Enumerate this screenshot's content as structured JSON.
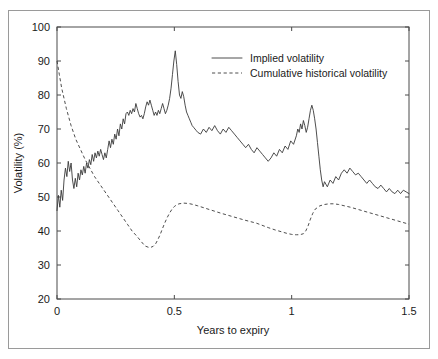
{
  "chart_data": {
    "type": "line",
    "title": "",
    "xlabel": "Years to expiry",
    "ylabel": "Volatility (%)",
    "xlim": [
      0,
      1.5
    ],
    "ylim": [
      20,
      100
    ],
    "xticks": [
      "0",
      "0.5",
      "1",
      "1.5"
    ],
    "xtick_values": [
      0,
      0.5,
      1,
      1.5
    ],
    "yticks": [
      "20",
      "30",
      "40",
      "50",
      "60",
      "70",
      "80",
      "90",
      "100"
    ],
    "ytick_values": [
      20,
      30,
      40,
      50,
      60,
      70,
      80,
      90,
      100
    ],
    "grid": false,
    "legend_position": "upper center",
    "line_color": "#3a3a3a",
    "axis_color": "#4a4a4a",
    "border_color": "#9a9a9a",
    "series": [
      {
        "name": "Implied volatility",
        "style": "solid",
        "x": [
          0.0,
          0.006,
          0.012,
          0.018,
          0.024,
          0.03,
          0.036,
          0.042,
          0.048,
          0.054,
          0.06,
          0.066,
          0.072,
          0.078,
          0.084,
          0.09,
          0.096,
          0.102,
          0.108,
          0.114,
          0.12,
          0.126,
          0.132,
          0.138,
          0.144,
          0.15,
          0.156,
          0.162,
          0.168,
          0.174,
          0.18,
          0.186,
          0.192,
          0.198,
          0.204,
          0.21,
          0.216,
          0.222,
          0.228,
          0.234,
          0.24,
          0.246,
          0.252,
          0.258,
          0.264,
          0.27,
          0.276,
          0.282,
          0.288,
          0.294,
          0.3,
          0.306,
          0.312,
          0.318,
          0.324,
          0.33,
          0.336,
          0.342,
          0.348,
          0.354,
          0.36,
          0.366,
          0.372,
          0.378,
          0.384,
          0.39,
          0.396,
          0.402,
          0.408,
          0.414,
          0.42,
          0.426,
          0.432,
          0.438,
          0.444,
          0.45,
          0.456,
          0.462,
          0.468,
          0.474,
          0.48,
          0.486,
          0.492,
          0.498,
          0.504,
          0.51,
          0.516,
          0.522,
          0.528,
          0.534,
          0.54,
          0.546,
          0.552,
          0.558,
          0.564,
          0.57,
          0.576,
          0.582,
          0.588,
          0.594,
          0.6,
          0.612,
          0.624,
          0.636,
          0.648,
          0.66,
          0.672,
          0.684,
          0.696,
          0.708,
          0.72,
          0.732,
          0.744,
          0.756,
          0.768,
          0.78,
          0.792,
          0.804,
          0.816,
          0.828,
          0.84,
          0.852,
          0.864,
          0.876,
          0.888,
          0.9,
          0.912,
          0.924,
          0.936,
          0.948,
          0.96,
          0.972,
          0.984,
          0.996,
          1.008,
          1.02,
          1.026,
          1.032,
          1.038,
          1.044,
          1.05,
          1.056,
          1.062,
          1.068,
          1.074,
          1.08,
          1.086,
          1.092,
          1.098,
          1.104,
          1.11,
          1.116,
          1.122,
          1.128,
          1.134,
          1.14,
          1.152,
          1.164,
          1.176,
          1.188,
          1.2,
          1.212,
          1.224,
          1.236,
          1.248,
          1.26,
          1.272,
          1.284,
          1.296,
          1.308,
          1.32,
          1.332,
          1.344,
          1.356,
          1.368,
          1.38,
          1.392,
          1.404,
          1.416,
          1.428,
          1.44,
          1.452,
          1.464,
          1.476,
          1.488,
          1.5
        ],
        "y": [
          46.0,
          50.5,
          47.0,
          52.0,
          49.0,
          55.0,
          58.5,
          56.0,
          60.5,
          57.5,
          60.0,
          55.0,
          52.5,
          55.5,
          53.0,
          57.0,
          55.0,
          58.0,
          56.5,
          59.0,
          57.0,
          60.0,
          58.5,
          61.0,
          59.5,
          62.5,
          60.5,
          63.0,
          61.5,
          63.5,
          62.0,
          64.0,
          62.5,
          61.0,
          63.0,
          61.5,
          64.0,
          66.5,
          64.5,
          67.0,
          65.5,
          68.5,
          67.0,
          70.0,
          68.0,
          71.5,
          70.0,
          73.0,
          71.5,
          74.5,
          75.0,
          74.0,
          75.5,
          74.5,
          76.0,
          75.0,
          77.5,
          76.0,
          74.5,
          73.5,
          74.0,
          73.0,
          74.5,
          76.5,
          78.0,
          77.0,
          78.5,
          77.0,
          75.5,
          74.0,
          75.0,
          74.0,
          75.5,
          74.5,
          76.0,
          77.5,
          76.0,
          74.5,
          75.5,
          77.0,
          79.0,
          82.0,
          86.0,
          90.0,
          93.0,
          89.0,
          84.0,
          80.0,
          79.0,
          81.0,
          79.5,
          77.0,
          75.0,
          74.0,
          73.0,
          72.0,
          71.0,
          70.5,
          70.0,
          69.5,
          69.0,
          68.5,
          70.0,
          69.0,
          70.5,
          69.5,
          71.0,
          69.5,
          68.5,
          70.0,
          69.0,
          70.5,
          69.5,
          68.5,
          67.5,
          66.5,
          65.5,
          64.5,
          65.5,
          64.0,
          63.0,
          64.5,
          63.5,
          62.5,
          61.5,
          60.5,
          61.5,
          63.0,
          62.0,
          64.0,
          63.0,
          65.0,
          64.0,
          66.5,
          65.5,
          68.0,
          70.0,
          69.0,
          71.5,
          70.0,
          72.5,
          71.0,
          69.0,
          70.5,
          73.0,
          75.5,
          77.0,
          75.5,
          73.0,
          70.0,
          66.0,
          62.0,
          58.0,
          55.0,
          53.0,
          54.5,
          53.0,
          55.0,
          54.0,
          56.0,
          55.0,
          57.0,
          58.0,
          57.0,
          58.5,
          57.5,
          56.5,
          57.0,
          56.0,
          55.0,
          54.0,
          55.0,
          54.0,
          53.0,
          52.5,
          53.5,
          52.5,
          51.5,
          52.5,
          51.5,
          51.0,
          52.0,
          51.0,
          52.0,
          51.5,
          51.0
        ]
      },
      {
        "name": "Cumulative historical volatility",
        "style": "dashed",
        "x": [
          0.0,
          0.01,
          0.02,
          0.03,
          0.04,
          0.05,
          0.06,
          0.07,
          0.08,
          0.09,
          0.1,
          0.12,
          0.14,
          0.16,
          0.18,
          0.2,
          0.22,
          0.24,
          0.26,
          0.28,
          0.3,
          0.32,
          0.34,
          0.36,
          0.375,
          0.39,
          0.4,
          0.41,
          0.42,
          0.43,
          0.44,
          0.45,
          0.46,
          0.47,
          0.48,
          0.49,
          0.5,
          0.51,
          0.52,
          0.54,
          0.56,
          0.58,
          0.6,
          0.65,
          0.7,
          0.75,
          0.8,
          0.85,
          0.9,
          0.93,
          0.96,
          0.98,
          1.0,
          1.01,
          1.02,
          1.03,
          1.04,
          1.05,
          1.06,
          1.07,
          1.08,
          1.09,
          1.1,
          1.12,
          1.14,
          1.16,
          1.18,
          1.2,
          1.25,
          1.3,
          1.35,
          1.4,
          1.45,
          1.5
        ],
        "y": [
          90.0,
          86.0,
          82.0,
          79.0,
          76.0,
          73.5,
          71.0,
          69.0,
          67.0,
          65.5,
          64.0,
          61.0,
          58.5,
          56.0,
          54.0,
          52.0,
          50.0,
          48.0,
          46.0,
          44.0,
          42.0,
          40.0,
          38.5,
          36.8,
          35.6,
          35.2,
          35.2,
          35.5,
          36.2,
          37.5,
          39.0,
          40.8,
          42.5,
          44.0,
          45.3,
          46.4,
          47.2,
          47.7,
          48.0,
          48.2,
          48.1,
          47.8,
          47.4,
          46.3,
          45.2,
          44.2,
          43.2,
          42.3,
          41.0,
          40.3,
          39.7,
          39.3,
          39.0,
          38.9,
          38.9,
          38.9,
          39.0,
          39.2,
          40.0,
          41.5,
          43.5,
          45.2,
          46.4,
          47.4,
          47.8,
          48.0,
          48.0,
          47.8,
          47.0,
          46.0,
          45.0,
          44.0,
          43.0,
          42.0
        ]
      }
    ]
  },
  "legend": {
    "items": [
      {
        "label": "Implied volatility",
        "style": "solid"
      },
      {
        "label": "Cumulative historical volatility",
        "style": "dashed"
      }
    ]
  },
  "axes": {
    "x_title": "Years to expiry",
    "y_title": "Volatility (%)"
  }
}
